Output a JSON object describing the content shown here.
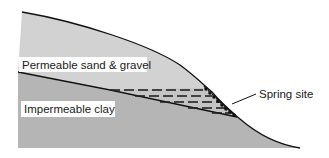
{
  "diagram": {
    "layers": [
      {
        "name": "Permeable sand & gravel",
        "color": "#cfcfcf"
      },
      {
        "name": "Impermeable clay",
        "color": "#b4b4b4"
      }
    ],
    "labels": {
      "sand": "Permeable sand & gravel",
      "clay": "Impermeable clay",
      "spring": "Spring site"
    },
    "colors": {
      "sand": "#d2d2d2",
      "clay": "#b5b5b5",
      "outline": "#111111",
      "water": "#222222"
    }
  }
}
